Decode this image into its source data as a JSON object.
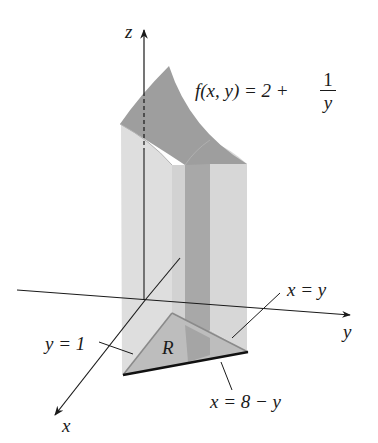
{
  "figure": {
    "function_label": {
      "lhs": "f(x, y) = 2 +",
      "numerator": "1",
      "denominator": "y"
    },
    "axes": {
      "x": "x",
      "y": "y",
      "z": "z"
    },
    "region_label": "R",
    "boundary_labels": {
      "y_eq_1": "y = 1",
      "x_eq_y": "x = y",
      "x_eq_8_minus_y": "x = 8 − y"
    },
    "colors": {
      "top_surface": "#9d9d9d",
      "side_light": "#dcdcdc",
      "side_mid": "#cfcfcf",
      "strip_dark": "#a6a6a6",
      "region_fill": "#bdbdbd",
      "axis": "#1a1a1a",
      "boundary_bold": "#111111",
      "boundary_gray": "#8a8a8a"
    }
  }
}
